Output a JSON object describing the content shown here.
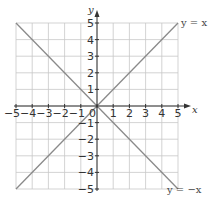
{
  "chart_data": {
    "type": "line",
    "title": "",
    "xlabel": "x",
    "ylabel": "y",
    "xlim": [
      -5,
      5
    ],
    "ylim": [
      -5,
      5
    ],
    "grid": true,
    "x_ticks": [
      -5,
      -4,
      -3,
      -2,
      -1,
      0,
      1,
      2,
      3,
      4,
      5
    ],
    "y_ticks": [
      -5,
      -4,
      -3,
      -2,
      -1,
      1,
      2,
      3,
      4,
      5
    ],
    "origin_label": "0",
    "series": [
      {
        "name": "y = x",
        "x": [
          -5,
          5
        ],
        "y": [
          -5,
          5
        ],
        "label_position": "top-right"
      },
      {
        "name": "y = −x",
        "x": [
          -5,
          5
        ],
        "y": [
          5,
          -5
        ],
        "label_position": "bottom-right"
      }
    ],
    "colors": {
      "grid": "#c8c8c8",
      "axis": "#333333",
      "line": "#8a8a8a"
    }
  }
}
